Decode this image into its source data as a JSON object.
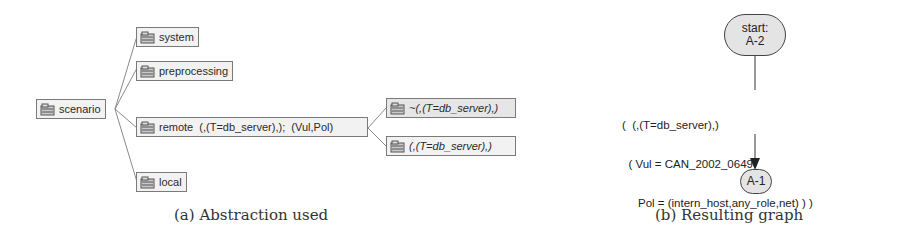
{
  "panel_a": {
    "caption": "(a) Abstraction used",
    "root": {
      "label": "scenario"
    },
    "children": [
      {
        "label": "system"
      },
      {
        "label": "preprocessing"
      },
      {
        "label": "remote  (,(T=db_server),);  (Vul,Pol)"
      },
      {
        "label": "local"
      }
    ],
    "remote_children": [
      {
        "label": "~(,(T=db_server),)"
      },
      {
        "label": "(,(T=db_server),)"
      }
    ]
  },
  "panel_b": {
    "caption": "(b) Resulting graph",
    "start_node": {
      "line1": "start:",
      "line2": "A-2"
    },
    "edge_label": {
      "line1": "(  (,(T=db_server),)",
      "line2": "  ( Vul = CAN_2002_0649",
      "line3": "     Pol = (intern_host,any_role,net) ) )"
    },
    "end_node": {
      "label": "A-1"
    }
  }
}
